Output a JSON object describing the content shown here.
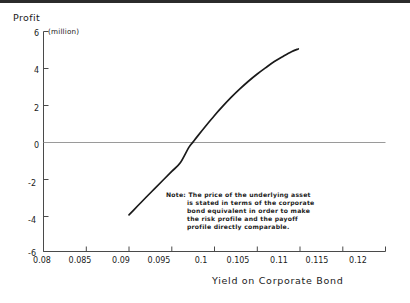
{
  "chart_data": {
    "type": "line",
    "title": "",
    "ylabel": "Profit",
    "yunits": "(million)",
    "xlabel": "Yield on Corporate Bond",
    "xlim": [
      0.08,
      0.12
    ],
    "ylim": [
      -6,
      6
    ],
    "grid": false,
    "legend": "none",
    "zero_line": true,
    "xticks": [
      "0.08",
      "0.085",
      "0.09",
      "0.095",
      "0.1",
      "0.105",
      "0.11",
      "0.115",
      "0.12"
    ],
    "xtick_values": [
      0.08,
      0.085,
      0.09,
      0.095,
      0.1,
      0.105,
      0.11,
      0.115,
      0.12
    ],
    "yticks": [
      "6",
      "4",
      "2",
      "0",
      "-2",
      "-4",
      "-6"
    ],
    "ytick_values": [
      6,
      4,
      2,
      0,
      -2,
      -4,
      -6
    ],
    "series": [
      {
        "name": "Profit",
        "color": "#1a1a1a",
        "x": [
          0.09,
          0.091,
          0.092,
          0.093,
          0.094,
          0.095,
          0.096,
          0.097,
          0.0975,
          0.098,
          0.099,
          0.1,
          0.101,
          0.102,
          0.103,
          0.104,
          0.105,
          0.106,
          0.107,
          0.108,
          0.109,
          0.1098
        ],
        "y": [
          -4.0,
          -3.52,
          -3.04,
          -2.57,
          -2.1,
          -1.63,
          -1.16,
          -0.32,
          -0.02,
          0.28,
          0.86,
          1.42,
          1.94,
          2.43,
          2.88,
          3.3,
          3.68,
          4.03,
          4.36,
          4.64,
          4.9,
          5.05
        ]
      }
    ],
    "annotations": {
      "note": {
        "lines": [
          "Note:  The price of the underlying asset",
          "is stated in terms of the corporate",
          "bond equivalent in order to make",
          "the risk profile and the payoff",
          "profile directly comparable."
        ]
      }
    }
  },
  "axes": {
    "y_title": "Profit",
    "y_units": "(million)",
    "x_title": "Yield on Corporate Bond"
  },
  "colors": {
    "curve": "#1a1a1a",
    "axis": "#4a4a4a",
    "zero_line": "#9a9a9a",
    "text": "#1a1a1a",
    "top_rule": "#2b2b2b"
  }
}
